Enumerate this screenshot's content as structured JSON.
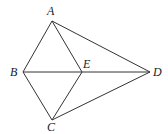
{
  "diagram": {
    "points": {
      "A": {
        "label": "A",
        "x": 52,
        "y": 21
      },
      "B": {
        "label": "B",
        "x": 23,
        "y": 72
      },
      "C": {
        "label": "C",
        "x": 52,
        "y": 120
      },
      "D": {
        "label": "D",
        "x": 150,
        "y": 72
      },
      "E": {
        "label": "E",
        "x": 82,
        "y": 72
      }
    },
    "segments": [
      [
        "A",
        "B"
      ],
      [
        "A",
        "E"
      ],
      [
        "A",
        "D"
      ],
      [
        "B",
        "E"
      ],
      [
        "E",
        "D"
      ],
      [
        "B",
        "C"
      ],
      [
        "C",
        "E"
      ],
      [
        "C",
        "D"
      ]
    ]
  }
}
